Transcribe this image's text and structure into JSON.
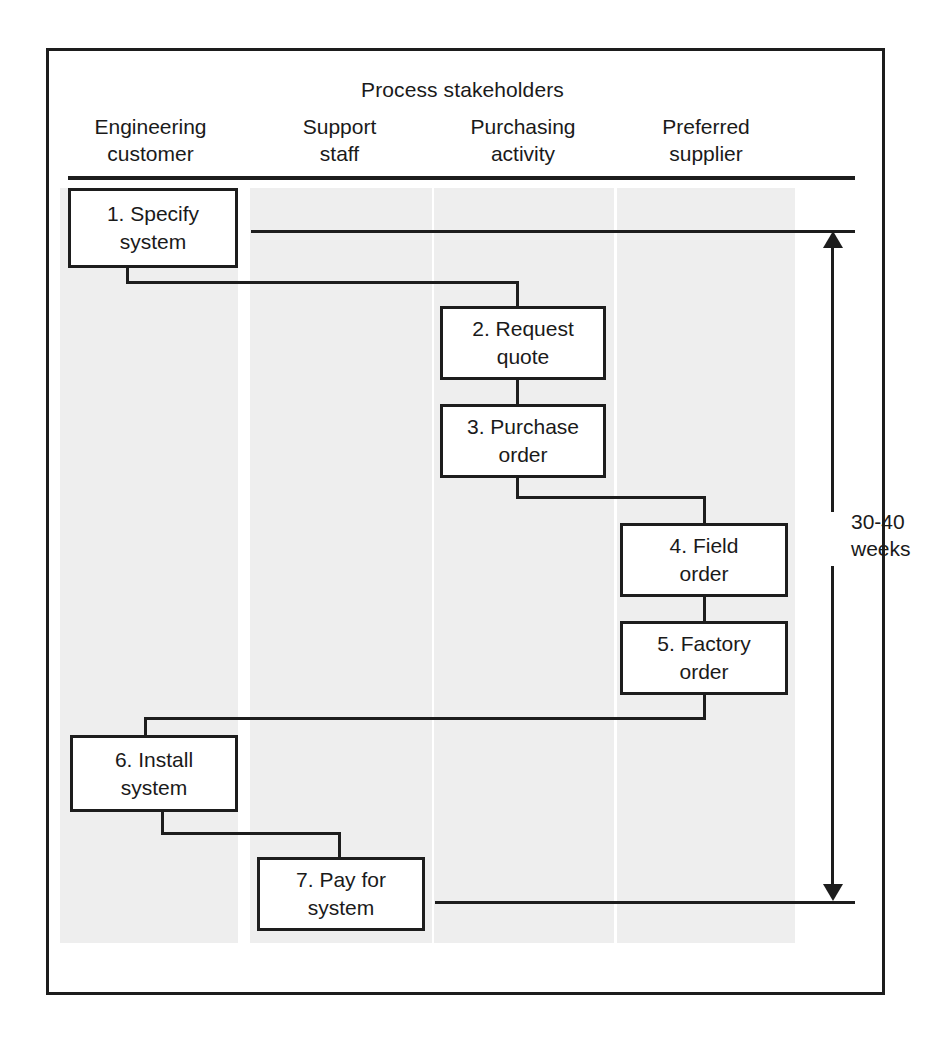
{
  "figure": {
    "title": "Process stakeholders",
    "lanes": [
      {
        "id": "engineering-customer",
        "line1": "Engineering",
        "line2": "customer"
      },
      {
        "id": "support-staff",
        "line1": "Support",
        "line2": "staff"
      },
      {
        "id": "purchasing-activity",
        "line1": "Purchasing",
        "line2": "activity"
      },
      {
        "id": "preferred-supplier",
        "line1": "Preferred",
        "line2": "supplier"
      }
    ],
    "steps": [
      {
        "num": "1",
        "line1": "1. Specify",
        "line2": "system",
        "lane": "engineering-customer"
      },
      {
        "num": "2",
        "line1": "2. Request",
        "line2": "quote",
        "lane": "purchasing-activity"
      },
      {
        "num": "3",
        "line1": "3. Purchase",
        "line2": "order",
        "lane": "purchasing-activity"
      },
      {
        "num": "4",
        "line1": "4. Field",
        "line2": "order",
        "lane": "preferred-supplier"
      },
      {
        "num": "5",
        "line1": "5. Factory",
        "line2": "order",
        "lane": "preferred-supplier"
      },
      {
        "num": "6",
        "line1": "6. Install",
        "line2": "system",
        "lane": "engineering-customer"
      },
      {
        "num": "7",
        "line1": "7. Pay for",
        "line2": "system",
        "lane": "support-staff"
      }
    ],
    "duration": {
      "line1": "30-40",
      "line2": "weeks"
    },
    "colors": {
      "ink": "#1d1d1d",
      "lane_band": "#eeeeee",
      "page": "#ffffff"
    }
  }
}
